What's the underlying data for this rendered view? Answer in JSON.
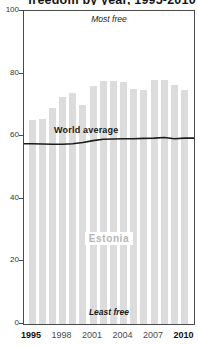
{
  "title_fragment": "freedom by year, 1995-2010",
  "chart_data": {
    "type": "bar",
    "title": "",
    "xlabel": "",
    "ylabel": "",
    "categories": [
      1995,
      1996,
      1997,
      1998,
      1999,
      2000,
      2001,
      2002,
      2003,
      2004,
      2005,
      2006,
      2007,
      2008,
      2009,
      2010
    ],
    "series": [
      {
        "name": "Estonia",
        "type": "bar",
        "values": [
          65.2,
          65.4,
          69.1,
          72.5,
          73.8,
          69.9,
          76.1,
          77.6,
          77.7,
          77.4,
          75.2,
          74.9,
          78.0,
          77.9,
          76.4,
          74.7
        ]
      },
      {
        "name": "World average",
        "type": "line",
        "values": [
          57.6,
          57.5,
          57.4,
          57.4,
          57.6,
          58.0,
          58.6,
          59.0,
          59.1,
          59.2,
          59.2,
          59.3,
          59.4,
          59.6,
          59.2,
          59.4
        ]
      }
    ],
    "ylim": [
      0,
      100
    ],
    "yticks": [
      0,
      20,
      40,
      60,
      80,
      100
    ],
    "xticks": [
      1995,
      1998,
      2001,
      2004,
      2007,
      2010
    ],
    "bold_xticks": [
      1995,
      2010
    ],
    "grid": false,
    "legend_position": "none",
    "annotations": {
      "top": "Most free",
      "bottom": "Least free"
    }
  },
  "labels": {
    "bar_series": "Estonia",
    "line_series": "World average",
    "most_free": "Most free",
    "least_free": "Least free"
  },
  "colors": {
    "bar": "#dcdcdc",
    "line": "#1c1c1c",
    "axis_border": "#4a4a4a",
    "ytick_text": "#333333",
    "xtick_text": "#4a4a4a",
    "xtick_bold_text": "#111111",
    "estonia_label": "#b5b5b5",
    "annotation_text": "#1a1a1a"
  }
}
